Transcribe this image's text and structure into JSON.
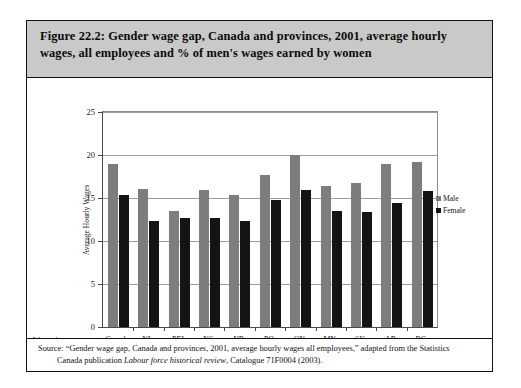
{
  "figure": {
    "caption_line1": "Figure 22.2: Gender wage gap, Canada and provinces, 2001, average hourly",
    "caption_line2": "wages, all employees and % of men's wages earned by women",
    "axis_note_line1": "Women's wages as a",
    "axis_note_line2": "percentage of men's",
    "source_line1_a": "Source: “Gender wage gap, Canada and provinces, 2001, average hourly wages all employees,” adapted from the Statistics",
    "source_line2_a": "Canada publication ",
    "source_line2_italic": "Labour force historical review",
    "source_line2_b": ", Catalogue 71F0004 (2003)."
  },
  "colors": {
    "male": "#7d7d7d",
    "female": "#141414",
    "caption_background": "#c9c9c9",
    "frame": "#111111",
    "gridline": "#9d9d9d"
  },
  "chart_data": {
    "type": "bar",
    "title": "Figure 22.2: Gender wage gap, Canada and provinces, 2001, average hourly wages, all employees and % of men's wages earned by women",
    "xlabel": "",
    "ylabel": "Average Hourly Wages",
    "ylim": [
      0,
      25
    ],
    "yticks": [
      0,
      5,
      10,
      15,
      20,
      25
    ],
    "ytick_labels": [
      "0",
      "5",
      "10",
      "15",
      "20",
      "25"
    ],
    "grid": true,
    "legend_position": "right",
    "categories": [
      "Canada",
      "NL",
      "PEI",
      "NS",
      "NB",
      "PQ",
      "ON",
      "MN",
      "SK",
      "AB",
      "BC"
    ],
    "category_percentages": [
      "(80.7%)",
      "(77%)",
      "(94.3%)",
      "(80.9%)",
      "(78.7%)",
      "(83.1%)",
      "(79.7%)",
      "(82.2%)",
      "(79.5%)",
      "(77.2%)",
      "(82.5%)"
    ],
    "series": [
      {
        "name": "Male",
        "color": "#7d7d7d",
        "values": [
          19.0,
          16.1,
          13.5,
          15.9,
          15.4,
          17.7,
          20.0,
          16.4,
          16.8,
          18.9,
          19.2
        ]
      },
      {
        "name": "Female",
        "color": "#141414",
        "values": [
          15.3,
          12.3,
          12.7,
          12.7,
          12.3,
          14.8,
          15.9,
          13.5,
          13.4,
          14.4,
          15.8
        ]
      }
    ]
  }
}
